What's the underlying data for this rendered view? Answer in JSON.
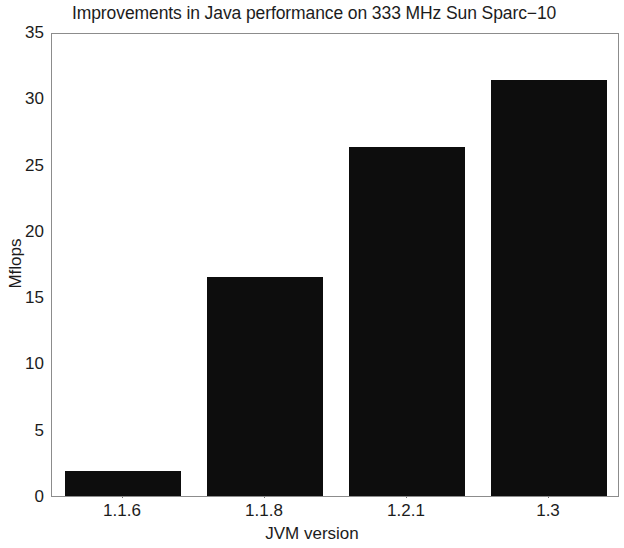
{
  "chart_data": {
    "type": "bar",
    "title": "Improvements in Java performance on 333 MHz Sun Sparc−10",
    "xlabel": "JVM version",
    "ylabel": "Mflops",
    "categories": [
      "1.1.6",
      "1.1.8",
      "1.2.1",
      "1.3"
    ],
    "values": [
      1.85,
      16.5,
      26.3,
      31.4
    ],
    "ylim": [
      0,
      35
    ],
    "ytick_labels": [
      "0",
      "5",
      "10",
      "15",
      "20",
      "25",
      "30",
      "35"
    ],
    "ytick_values": [
      0,
      5,
      10,
      15,
      20,
      25,
      30,
      35
    ],
    "grid": false,
    "legend": null,
    "bar_color": "#0d0d0d",
    "axis_color": "#8c8c8c",
    "background_color": "#ffffff",
    "series": [
      {
        "name": "Mflops",
        "values": [
          1.85,
          16.5,
          26.3,
          31.4
        ]
      }
    ]
  }
}
